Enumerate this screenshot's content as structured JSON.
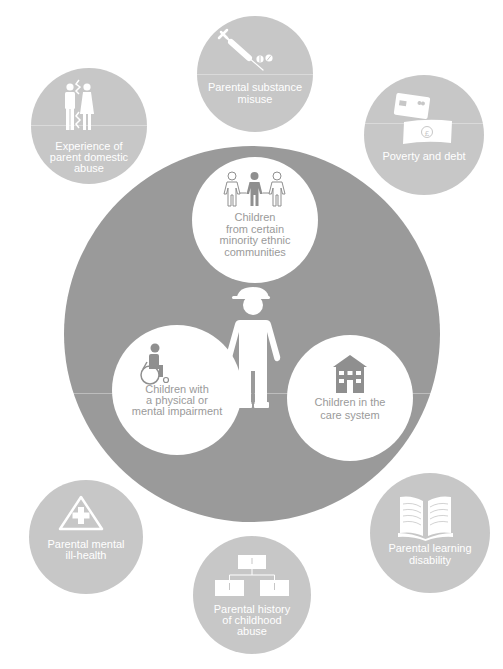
{
  "diagram": {
    "center": {
      "label": "child",
      "icon": "child-with-cap-icon",
      "color": "#9a9a9a"
    },
    "inner_factors": [
      {
        "id": "ethnic",
        "icon": "three-children-icon",
        "lines": [
          "Children",
          "from certain",
          "minority ethnic",
          "communities"
        ]
      },
      {
        "id": "impairment",
        "icon": "wheelchair-icon",
        "lines": [
          "Children with",
          "a physical or",
          "mental impairment"
        ]
      },
      {
        "id": "care",
        "icon": "house-icon",
        "lines": [
          "Children in the",
          "care system"
        ]
      }
    ],
    "outer_factors": [
      {
        "id": "substance",
        "icon": "syringe-pills-icon",
        "lines": [
          "Parental substance",
          "misuse"
        ]
      },
      {
        "id": "domestic",
        "icon": "broken-couple-icon",
        "lines": [
          "Experience of",
          "parent domestic",
          "abuse"
        ]
      },
      {
        "id": "poverty",
        "icon": "card-and-banknote-icon",
        "lines": [
          "Poverty and debt"
        ]
      },
      {
        "id": "mental",
        "icon": "warning-cross-icon",
        "lines": [
          "Parental mental",
          "ill-health"
        ]
      },
      {
        "id": "history",
        "icon": "family-tree-icon",
        "lines": [
          "Parental history",
          "of childhood",
          "abuse"
        ]
      },
      {
        "id": "learning",
        "icon": "open-book-icon",
        "lines": [
          "Parental learning",
          "disability"
        ]
      }
    ],
    "colors": {
      "big_circle": "#9a9a9a",
      "outer_circle": "#c7c7c7",
      "inner_circle": "#ffffff",
      "inner_text": "#9a9a9a",
      "outer_text": "#ffffff"
    }
  }
}
